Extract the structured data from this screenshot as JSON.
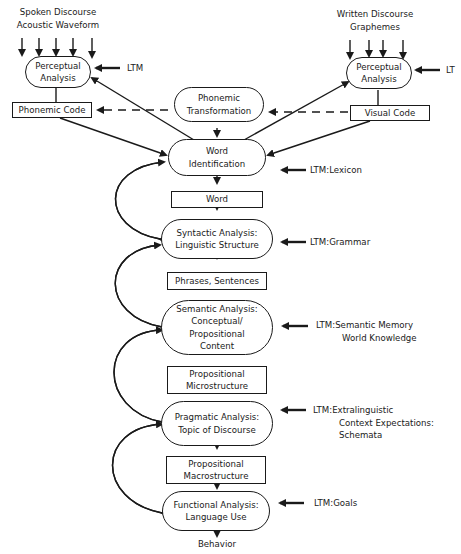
{
  "inputs": {
    "spoken": {
      "line1": "Spoken Discourse",
      "line2": "Acoustic Waveform"
    },
    "written": {
      "line1": "Written Discourse",
      "line2": "Graphemes"
    }
  },
  "left_perceptual": {
    "line1": "Perceptual",
    "line2": "Analysis",
    "ltm": "LTM"
  },
  "right_perceptual": {
    "line1": "Perceptual",
    "line2": "Analysis",
    "ltm": "LT"
  },
  "phonemic_code": "Phonemic Code",
  "visual_code": "Visual Code",
  "phonemic_transformation": {
    "line1": "Phonemic",
    "line2": "Transformation"
  },
  "stages": [
    {
      "line1": "Word",
      "line2": "Identification",
      "ltm": "LTM:Lexicon"
    },
    {
      "line1": "Syntactic Analysis:",
      "line2": "Linguistic  Structure",
      "ltm": "LTM:Grammar"
    },
    {
      "line1": "Semantic Analysis:",
      "line2": "Conceptual/",
      "line3": "Propositional",
      "line4": "Content",
      "ltm_line1": "LTM:Semantic Memory",
      "ltm_line2": "World  Knowledge"
    },
    {
      "line1": "Pragmatic Analysis:",
      "line2": "Topic of Discourse",
      "ltm_line1": "LTM:Extralinguistic",
      "ltm_line2": "Context Expectations:",
      "ltm_line3": "Schemata"
    },
    {
      "line1": "Functional Analysis:",
      "line2": "Language Use",
      "ltm": "LTM:Goals"
    }
  ],
  "outputs": [
    {
      "line1": "Word"
    },
    {
      "line1": "Phrases, Sentences"
    },
    {
      "line1": "Propositional",
      "line2": "Microstructure"
    },
    {
      "line1": "Propositional",
      "line2": "Macrostructure"
    }
  ],
  "final_output": "Behavior"
}
